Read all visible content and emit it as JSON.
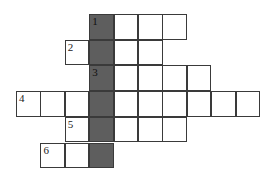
{
  "puzzle": {
    "type": "crossword",
    "highlight_color": "#5e5e5e",
    "grid_line_color": "#3a3a3a",
    "shaded_column": 3,
    "rows": [
      {
        "clue_number": "1",
        "start_col": 3,
        "length": 4
      },
      {
        "clue_number": "2",
        "start_col": 2,
        "length": 4
      },
      {
        "clue_number": "3",
        "start_col": 3,
        "length": 5
      },
      {
        "clue_number": "4",
        "start_col": 0,
        "length": 10
      },
      {
        "clue_number": "5",
        "start_col": 2,
        "length": 5
      },
      {
        "clue_number": "6",
        "start_col": 1,
        "length": 3
      }
    ]
  }
}
